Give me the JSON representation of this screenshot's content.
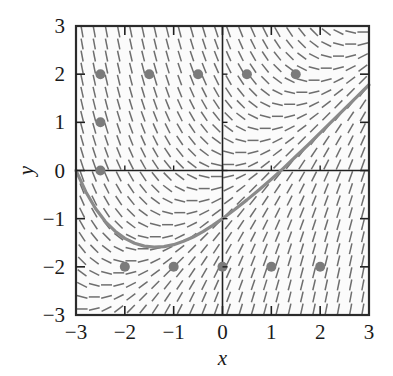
{
  "figure": {
    "title": "",
    "background_color": "#ffffff",
    "frame_color": "#2b2b2b",
    "plot_area": {
      "left": 76,
      "top": 26,
      "right": 369,
      "bottom": 315
    }
  },
  "axes": {
    "x": {
      "label": "x",
      "min": -3,
      "max": 3,
      "ticks": [
        -3,
        -2,
        -1,
        0,
        1,
        2,
        3
      ],
      "ticklabels": [
        "−3",
        "−2",
        "−1",
        "0",
        "1",
        "2",
        "3"
      ]
    },
    "y": {
      "label": "y",
      "min": -3,
      "max": 3,
      "ticks": [
        -3,
        -2,
        -1,
        0,
        1,
        2,
        3
      ],
      "ticklabels": [
        "−3",
        "−2",
        "−1",
        "0",
        "1",
        "2",
        "3"
      ]
    }
  },
  "chart_data": {
    "type": "line",
    "title": "",
    "xlabel": "x",
    "ylabel": "y",
    "xlim": [
      -3,
      3
    ],
    "ylim": [
      -3,
      3
    ],
    "grid": false,
    "legend": null,
    "slope_field": {
      "description": "direction-field of short line segments on a uniform grid",
      "grid_nx": 24,
      "grid_ny": 24,
      "segment_color": "#6e6e6e",
      "segment_length_px": 11,
      "slope_formula": "dy/dx = x - y"
    },
    "solution_curve": {
      "name": "solution curve",
      "color": "#8a8a8a",
      "width_px": 3.2,
      "formula": "y = x - 1 + (-2)e^{-(x+3)} passing through (-3, 0)",
      "points": [
        {
          "x": -3.0,
          "y": 0.0
        },
        {
          "x": -2.8,
          "y": -0.44
        },
        {
          "x": -2.6,
          "y": -0.79
        },
        {
          "x": -2.4,
          "y": -1.06
        },
        {
          "x": -2.2,
          "y": -1.26
        },
        {
          "x": -2.0,
          "y": -1.41
        },
        {
          "x": -1.8,
          "y": -1.51
        },
        {
          "x": -1.6,
          "y": -1.57
        },
        {
          "x": -1.4,
          "y": -1.59
        },
        {
          "x": -1.2,
          "y": -1.58
        },
        {
          "x": -1.0,
          "y": -1.54
        },
        {
          "x": -0.8,
          "y": -1.47
        },
        {
          "x": -0.6,
          "y": -1.38
        },
        {
          "x": -0.4,
          "y": -1.27
        },
        {
          "x": -0.2,
          "y": -1.14
        },
        {
          "x": 0.0,
          "y": -1.0
        },
        {
          "x": 0.25,
          "y": -0.81
        },
        {
          "x": 0.5,
          "y": -0.61
        },
        {
          "x": 0.75,
          "y": -0.4
        },
        {
          "x": 1.0,
          "y": -0.18
        },
        {
          "x": 1.25,
          "y": 0.05
        },
        {
          "x": 1.5,
          "y": 0.29
        },
        {
          "x": 1.75,
          "y": 0.53
        },
        {
          "x": 2.0,
          "y": 0.78
        },
        {
          "x": 2.25,
          "y": 1.03
        },
        {
          "x": 2.5,
          "y": 1.28
        },
        {
          "x": 2.75,
          "y": 1.53
        },
        {
          "x": 3.0,
          "y": 1.78
        }
      ]
    },
    "marked_points": {
      "name": "initial condition points",
      "color": "#7b7b7b",
      "radius_px": 5,
      "values": [
        {
          "x": -2.5,
          "y": 2
        },
        {
          "x": -1.5,
          "y": 2
        },
        {
          "x": -0.5,
          "y": 2
        },
        {
          "x": 0.5,
          "y": 2
        },
        {
          "x": 1.5,
          "y": 2
        },
        {
          "x": -2.5,
          "y": 1
        },
        {
          "x": -2.5,
          "y": 0
        },
        {
          "x": -2.0,
          "y": -2
        },
        {
          "x": -1.0,
          "y": -2
        },
        {
          "x": 0.0,
          "y": -2
        },
        {
          "x": 1.0,
          "y": -2
        },
        {
          "x": 2.0,
          "y": -2
        }
      ]
    }
  }
}
